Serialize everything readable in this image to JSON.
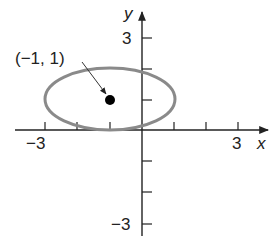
{
  "figure": {
    "x_axis": {
      "label": "x",
      "tick_labels": {
        "min": "−3",
        "max": "3"
      },
      "range": [
        -3,
        3
      ]
    },
    "y_axis": {
      "label": "y",
      "tick_labels": {
        "max": "3",
        "min": "−3"
      },
      "range": [
        -3,
        3
      ]
    },
    "ellipse": {
      "center": [
        -1,
        1
      ],
      "semi_axis_x": 2,
      "semi_axis_y": 1,
      "color": "#8a8a8a"
    },
    "point": {
      "label": "(−1, 1)",
      "coords": [
        -1,
        1
      ],
      "color": "#000000"
    }
  }
}
